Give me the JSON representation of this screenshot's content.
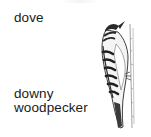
{
  "items": [
    {
      "label": "dove"
    },
    {
      "label": "downy woodpecker",
      "lines": [
        "downy",
        "woodpecker"
      ],
      "image": "downy-woodpecker-illustration"
    }
  ],
  "colors": {
    "text": "#1a1a1a",
    "background": "#ffffff",
    "illustration_ink": "#2a2a2a"
  }
}
